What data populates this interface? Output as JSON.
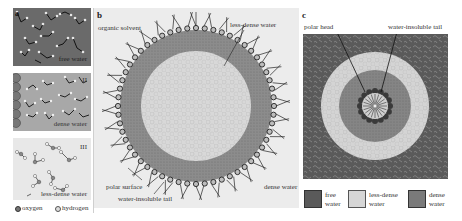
{
  "figure": {
    "panels": [
      {
        "id": "a",
        "letter": "a",
        "subpanels": [
          {
            "id": "I",
            "roman": "I",
            "label": "free water",
            "background": "#6a6a6a"
          },
          {
            "id": "II",
            "roman": "II",
            "label": "dense water",
            "background": "#a8a8a8"
          },
          {
            "id": "III",
            "roman": "III",
            "label": "less-dense water",
            "background": "#e8e8e8"
          }
        ],
        "legend": [
          {
            "symbol": "oxygen-dot",
            "label": "oxygen"
          },
          {
            "symbol": "hydrogen-dot",
            "label": "hydrogen"
          }
        ]
      },
      {
        "id": "b",
        "letter": "b",
        "labels": {
          "organic_solvent": "organic solvent",
          "less_dense_water": "less-dense water",
          "polar_surface": "polar surface",
          "dense_water": "dense water",
          "water_insoluble_tail": "water-insoluble tail"
        }
      },
      {
        "id": "c",
        "letter": "c",
        "labels": {
          "polar_head": "polar head",
          "water_insoluble_tail": "water-insoluble tail"
        },
        "legend": [
          {
            "swatch": "free-water",
            "label_line1": "free",
            "label_line2": "water",
            "color": "#5a5a5a"
          },
          {
            "swatch": "less-dense-water",
            "label_line1": "less-dense",
            "label_line2": "water",
            "color": "#d6d6d6"
          },
          {
            "swatch": "dense-water",
            "label_line1": "dense",
            "label_line2": "water",
            "color": "#7a7a7a"
          }
        ]
      }
    ],
    "colors": {
      "free_water": "#5e5e5e",
      "dense_water": "#8a8a8a",
      "less_dense_water": "#d8d8d8",
      "organic_solvent": "#ececec",
      "surfactant_head": "#3a3a3a",
      "tail": "#222222"
    }
  }
}
